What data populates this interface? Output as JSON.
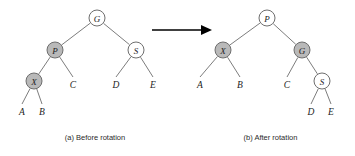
{
  "figure": {
    "type": "diagram",
    "colors": {
      "node_fill_light": "#ffffff",
      "node_fill_dark": "#b9b9b9",
      "node_stroke": "#6e6e6e",
      "edge": "#7d7d7d",
      "arrow": "#000000",
      "text": "#1c1c1c",
      "background": "#ffffff"
    },
    "panels": [
      {
        "id": "before",
        "caption": "(a) Before rotation",
        "nodes": [
          {
            "id": "b-G",
            "label": "G",
            "shade": "light",
            "cx": 97,
            "cy": 18,
            "r": 8
          },
          {
            "id": "b-P",
            "label": "P",
            "shade": "dark",
            "cx": 55,
            "cy": 50,
            "r": 8
          },
          {
            "id": "b-S",
            "label": "S",
            "shade": "light",
            "cx": 136,
            "cy": 50,
            "r": 8
          },
          {
            "id": "b-X",
            "label": "X",
            "shade": "dark",
            "cx": 34,
            "cy": 81,
            "r": 8
          }
        ],
        "leaves": [
          {
            "id": "b-A",
            "label": "A",
            "x": 22,
            "y": 115
          },
          {
            "id": "b-B",
            "label": "B",
            "x": 42,
            "y": 115
          },
          {
            "id": "b-C",
            "label": "C",
            "x": 73,
            "y": 88
          },
          {
            "id": "b-D",
            "label": "D",
            "x": 116,
            "y": 88
          },
          {
            "id": "b-E",
            "label": "E",
            "x": 153,
            "y": 88
          }
        ],
        "edges": [
          {
            "from": "b-G",
            "to": "b-P"
          },
          {
            "from": "b-G",
            "to": "b-S"
          },
          {
            "from": "b-P",
            "to": "b-X"
          },
          {
            "from": "b-P",
            "to": "b-C"
          },
          {
            "from": "b-S",
            "to": "b-D"
          },
          {
            "from": "b-S",
            "to": "b-E"
          },
          {
            "from": "b-X",
            "to": "b-A"
          },
          {
            "from": "b-X",
            "to": "b-B"
          }
        ]
      },
      {
        "id": "after",
        "caption": "(b) After rotation",
        "nodes": [
          {
            "id": "a-P",
            "label": "P",
            "shade": "light",
            "cx": 267,
            "cy": 18,
            "r": 8
          },
          {
            "id": "a-X",
            "label": "X",
            "shade": "dark",
            "cx": 223,
            "cy": 50,
            "r": 8
          },
          {
            "id": "a-G",
            "label": "G",
            "shade": "dark",
            "cx": 302,
            "cy": 50,
            "r": 8
          },
          {
            "id": "a-S",
            "label": "S",
            "shade": "light",
            "cx": 322,
            "cy": 81,
            "r": 8
          }
        ],
        "leaves": [
          {
            "id": "a-A",
            "label": "A",
            "x": 200,
            "y": 88
          },
          {
            "id": "a-B",
            "label": "B",
            "x": 240,
            "y": 88
          },
          {
            "id": "a-C",
            "label": "C",
            "x": 287,
            "y": 88
          },
          {
            "id": "a-D",
            "label": "D",
            "x": 311,
            "y": 115
          },
          {
            "id": "a-E",
            "label": "E",
            "x": 331,
            "y": 115
          }
        ],
        "edges": [
          {
            "from": "a-P",
            "to": "a-X"
          },
          {
            "from": "a-P",
            "to": "a-G"
          },
          {
            "from": "a-X",
            "to": "a-A"
          },
          {
            "from": "a-X",
            "to": "a-B"
          },
          {
            "from": "a-G",
            "to": "a-C"
          },
          {
            "from": "a-G",
            "to": "a-S"
          },
          {
            "from": "a-S",
            "to": "a-D"
          },
          {
            "from": "a-S",
            "to": "a-E"
          }
        ]
      }
    ],
    "arrow": {
      "name": "transformation-arrow",
      "x1": 152,
      "y1": 30,
      "x2": 212,
      "y2": 30
    }
  }
}
